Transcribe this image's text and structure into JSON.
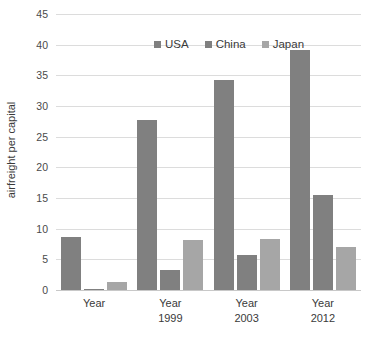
{
  "chart_data": {
    "type": "bar",
    "title": "",
    "subtitle": "",
    "xlabel": "",
    "ylabel": "airfreight per capital",
    "ylim": [
      0,
      45
    ],
    "ytick_step": 5,
    "yticks": [
      0,
      5,
      10,
      15,
      20,
      25,
      30,
      35,
      40,
      45
    ],
    "ytick_labels": [
      "0",
      "5",
      "10",
      "15",
      "20",
      "25",
      "30",
      "35",
      "40",
      "45"
    ],
    "grid": "horizontal",
    "legend_position": "top-center-inside",
    "categories": [
      "Year",
      "Year 1999",
      "Year 2003",
      "Year 2012"
    ],
    "category_lines": [
      [
        "Year"
      ],
      [
        "Year",
        "1999"
      ],
      [
        "Year",
        "2003"
      ],
      [
        "Year",
        "2012"
      ]
    ],
    "series": [
      {
        "name": "USA",
        "color": "#808080",
        "values": [
          8.6,
          27.8,
          34.2,
          39.1
        ]
      },
      {
        "name": "China",
        "color": "#808080",
        "values": [
          0.1,
          3.3,
          5.7,
          15.5
        ]
      },
      {
        "name": "Japan",
        "color": "#a6a6a6",
        "values": [
          1.3,
          8.2,
          8.3,
          7.0
        ]
      }
    ],
    "legend": [
      {
        "label": "USA",
        "color": "#808080"
      },
      {
        "label": "China",
        "color": "#808080"
      },
      {
        "label": "Japan",
        "color": "#a6a6a6"
      }
    ],
    "colors": {
      "gridline": "#dcdcdc",
      "baseline": "#c8c8c8",
      "text": "#3a3a3a",
      "background": "#ffffff",
      "series_dark": "#808080",
      "series_light": "#a6a6a6"
    }
  }
}
